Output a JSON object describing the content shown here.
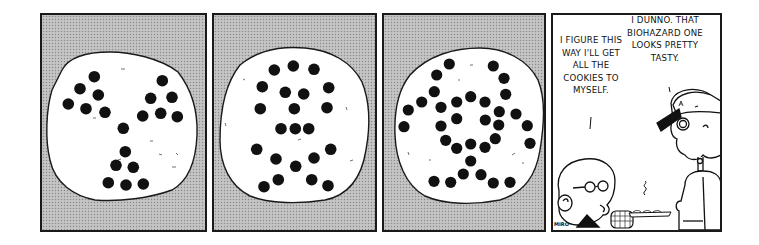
{
  "comic": {
    "panels": [
      {
        "id": "panel-1",
        "background": "halftone-gray",
        "subject": "cookie",
        "pattern": "biohazard-symbol"
      },
      {
        "id": "panel-2",
        "background": "halftone-gray",
        "subject": "cookie",
        "pattern": "skull-and-crossbones"
      },
      {
        "id": "panel-3",
        "background": "halftone-gray",
        "subject": "cookie",
        "pattern": "biohazard-swirl"
      },
      {
        "id": "panel-4",
        "background": "white",
        "balloons": {
          "left": "I figure this way I'll get all the cookies to myself.",
          "right": "I dunno. That biohazard one looks pretty tasty."
        },
        "characters": [
          "kid-with-glasses",
          "kid-with-cap"
        ],
        "props": [
          "cookie-tray",
          "steam"
        ]
      }
    ],
    "signature": "ᴹᴵᴿᴼ"
  },
  "colors": {
    "ink": "#1a1a1a",
    "halftone": "#bdbdbd",
    "cookie": "#ffffff",
    "chip": "#111111"
  }
}
